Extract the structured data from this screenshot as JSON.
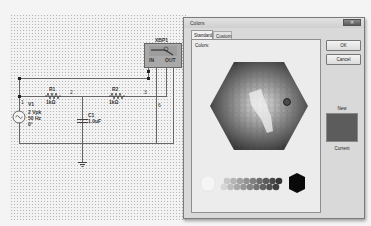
{
  "schematic": {
    "instrument": {
      "name": "XBP1",
      "pins": [
        "IN",
        "OUT"
      ]
    },
    "source": {
      "ref": "V1",
      "amplitude": "2 Vpk",
      "frequency": "50 Hz",
      "phase": "0°",
      "node": "1"
    },
    "resistors": [
      {
        "ref": "R1",
        "value": "1kΩ"
      },
      {
        "ref": "R2",
        "value": "1kΩ"
      }
    ],
    "capacitor": {
      "ref": "C1",
      "value": "1.0uF"
    },
    "node_labels": [
      "2",
      "3",
      "6"
    ]
  },
  "dialog": {
    "title": "Colors",
    "close_glyph": "✕",
    "tabs": [
      {
        "label": "Standard",
        "active": true
      },
      {
        "label": "Custom",
        "active": false
      }
    ],
    "colors_label": "Colors:",
    "ok_label": "OK",
    "cancel_label": "Cancel",
    "new_label": "New",
    "current_label": "Current",
    "new_color": "#5c5c5c"
  }
}
